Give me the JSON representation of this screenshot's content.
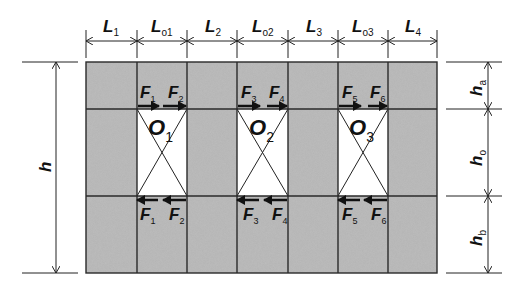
{
  "figure": {
    "type": "wall-with-openings-diagram",
    "colors": {
      "pier_fill": "#b4b4b4",
      "opening_fill": "#ffffff",
      "lines": "#222222",
      "arrows": "#111111"
    }
  },
  "top_dimensions": [
    {
      "main": "L",
      "sub": "1"
    },
    {
      "main": "L",
      "sub": "o1"
    },
    {
      "main": "L",
      "sub": "2"
    },
    {
      "main": "L",
      "sub": "o2"
    },
    {
      "main": "L",
      "sub": "3"
    },
    {
      "main": "L",
      "sub": "o3"
    },
    {
      "main": "L",
      "sub": "4"
    }
  ],
  "left_dimension": {
    "main": "h",
    "sub": ""
  },
  "right_dimensions": [
    {
      "main": "h",
      "sub": "a"
    },
    {
      "main": "h",
      "sub": "o"
    },
    {
      "main": "h",
      "sub": "b"
    }
  ],
  "openings": [
    {
      "main": "O",
      "sub": "1"
    },
    {
      "main": "O",
      "sub": "2"
    },
    {
      "main": "O",
      "sub": "3"
    }
  ],
  "forces_top": [
    {
      "main": "F",
      "sub": "1"
    },
    {
      "main": "F",
      "sub": "2"
    },
    {
      "main": "F",
      "sub": "3"
    },
    {
      "main": "F",
      "sub": "4"
    },
    {
      "main": "F",
      "sub": "5"
    },
    {
      "main": "F",
      "sub": "6"
    }
  ],
  "forces_bottom": [
    {
      "main": "F",
      "sub": "1"
    },
    {
      "main": "F",
      "sub": "2"
    },
    {
      "main": "F",
      "sub": "3"
    },
    {
      "main": "F",
      "sub": "4"
    },
    {
      "main": "F",
      "sub": "5"
    },
    {
      "main": "F",
      "sub": "6"
    }
  ]
}
